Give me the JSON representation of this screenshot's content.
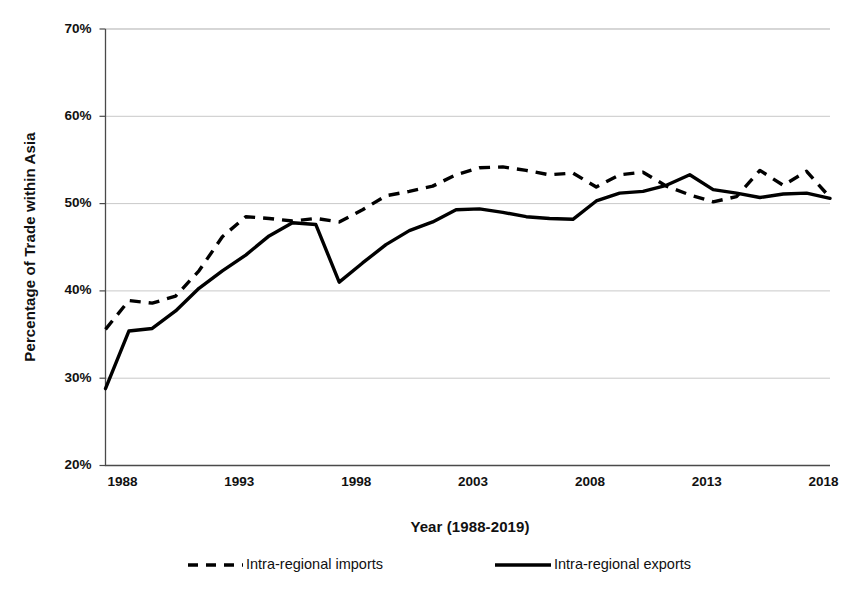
{
  "chart_data": {
    "type": "line",
    "title": "",
    "xlabel": "Year (1988-2019)",
    "ylabel": "Percentage of Trade within Asia",
    "xlim": [
      1988,
      2019
    ],
    "ylim": [
      20,
      70
    ],
    "ytick_labels": [
      "70%",
      "60%",
      "50%",
      "40%",
      "30%",
      "20%"
    ],
    "ytick_values": [
      70,
      60,
      50,
      40,
      30,
      20
    ],
    "xtick_labels": [
      "1988",
      "1993",
      "1998",
      "2003",
      "2008",
      "2013",
      "2018"
    ],
    "xtick_values": [
      1988,
      1993,
      1998,
      2003,
      2008,
      2013,
      2018
    ],
    "grid": "horizontal",
    "legend_position": "below",
    "x": [
      1988,
      1989,
      1990,
      1991,
      1992,
      1993,
      1994,
      1995,
      1996,
      1997,
      1998,
      1999,
      2000,
      2001,
      2002,
      2003,
      2004,
      2005,
      2006,
      2007,
      2008,
      2009,
      2010,
      2011,
      2012,
      2013,
      2014,
      2015,
      2016,
      2017,
      2018,
      2019
    ],
    "series": [
      {
        "name": "Intra-regional imports",
        "style": "dashed",
        "color": "#000000",
        "values": [
          35.6,
          38.9,
          38.6,
          39.4,
          42.3,
          46.2,
          48.5,
          48.3,
          48.0,
          48.3,
          47.9,
          49.3,
          50.9,
          51.4,
          52.0,
          53.3,
          54.1,
          54.2,
          53.8,
          53.3,
          53.5,
          51.9,
          53.3,
          53.6,
          52.0,
          51.0,
          50.2,
          50.8,
          53.8,
          52.1,
          53.7,
          50.7
        ]
      },
      {
        "name": "Intra-regional exports",
        "style": "solid",
        "color": "#000000",
        "values": [
          28.8,
          35.4,
          35.7,
          37.7,
          40.3,
          42.3,
          44.1,
          46.3,
          47.8,
          47.6,
          41.0,
          43.2,
          45.3,
          46.9,
          47.9,
          49.3,
          49.4,
          49.0,
          48.5,
          48.3,
          48.2,
          50.3,
          51.2,
          51.4,
          52.1,
          53.3,
          51.6,
          51.2,
          50.7,
          51.1,
          51.2,
          50.6
        ]
      }
    ]
  },
  "legend": {
    "items": [
      {
        "label": "Intra-regional imports",
        "style": "dashed"
      },
      {
        "label": "Intra-regional exports",
        "style": "solid"
      }
    ]
  }
}
